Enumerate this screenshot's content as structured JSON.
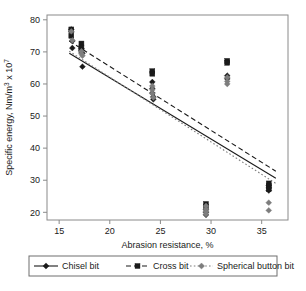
{
  "chart_data": {
    "type": "scatter",
    "title": "",
    "xlabel": "Abrasion resistance, %",
    "ylabel": "Specific energy, Nm/m3 x 107",
    "ylabel_parts": {
      "main": "Specific energy, Nm/m",
      "exp1": "3",
      "mid": " x 10",
      "exp2": "7"
    },
    "xlim": [
      13.8,
      37.6
    ],
    "ylim": [
      17.6,
      81.5
    ],
    "xticks": [
      15,
      20,
      25,
      30,
      35
    ],
    "yticks": [
      20,
      30,
      40,
      50,
      60,
      70,
      80
    ],
    "grid": false,
    "legend_position": "bottom",
    "series": [
      {
        "name": "Chisel bit",
        "marker": "diamond",
        "color": "#1a1a1a",
        "line_style": "solid",
        "points": [
          [
            16.2,
            77.0
          ],
          [
            16.2,
            76.2
          ],
          [
            16.3,
            73.4
          ],
          [
            16.3,
            71.2
          ],
          [
            17.2,
            71.0
          ],
          [
            17.2,
            70.4
          ],
          [
            17.3,
            69.6
          ],
          [
            17.3,
            65.4
          ],
          [
            24.2,
            60.6
          ],
          [
            24.2,
            58.6
          ],
          [
            24.2,
            57.2
          ],
          [
            24.3,
            56.0
          ],
          [
            24.3,
            55.2
          ],
          [
            31.6,
            62.6
          ],
          [
            31.6,
            61.6
          ],
          [
            29.5,
            20.8
          ],
          [
            29.5,
            20.0
          ],
          [
            29.5,
            19.2
          ],
          [
            35.7,
            28.4
          ],
          [
            35.7,
            27.6
          ],
          [
            35.7,
            26.8
          ]
        ],
        "fit": {
          "x": [
            16.0,
            36.4
          ],
          "y": [
            69.6,
            30.6
          ]
        }
      },
      {
        "name": "Cross bit",
        "marker": "square",
        "color": "#1a1a1a",
        "line_style": "dashed",
        "points": [
          [
            16.2,
            77.0
          ],
          [
            16.2,
            75.0
          ],
          [
            17.2,
            72.6
          ],
          [
            17.2,
            71.4
          ],
          [
            17.2,
            70.4
          ],
          [
            24.2,
            64.0
          ],
          [
            24.2,
            63.2
          ],
          [
            31.6,
            67.2
          ],
          [
            31.6,
            66.6
          ],
          [
            29.5,
            22.6
          ],
          [
            29.5,
            21.8
          ],
          [
            35.7,
            29.0
          ],
          [
            35.7,
            28.2
          ],
          [
            35.7,
            27.2
          ]
        ],
        "fit": {
          "x": [
            16.0,
            36.4
          ],
          "y": [
            73.4,
            32.8
          ]
        }
      },
      {
        "name": "Spherical button bit",
        "marker": "diamond-gray",
        "color": "#7d7d7d",
        "line_style": "dotted",
        "points": [
          [
            16.2,
            76.4
          ],
          [
            16.3,
            73.6
          ],
          [
            17.2,
            70.2
          ],
          [
            17.2,
            69.4
          ],
          [
            17.3,
            68.8
          ],
          [
            24.2,
            59.4
          ],
          [
            24.2,
            58.2
          ],
          [
            24.2,
            57.0
          ],
          [
            24.3,
            55.8
          ],
          [
            31.6,
            62.0
          ],
          [
            31.6,
            60.8
          ],
          [
            31.6,
            60.0
          ],
          [
            29.5,
            22.0
          ],
          [
            29.5,
            21.0
          ],
          [
            29.5,
            20.2
          ],
          [
            29.5,
            19.4
          ],
          [
            35.7,
            23.0
          ],
          [
            35.7,
            20.6
          ]
        ],
        "fit": {
          "x": [
            16.0,
            36.4
          ],
          "y": [
            70.2,
            29.0
          ]
        }
      }
    ],
    "legend": [
      {
        "label": "Chisel bit",
        "marker": "diamond",
        "color": "#1a1a1a",
        "line_style": "solid"
      },
      {
        "label": "Cross bit",
        "marker": "square",
        "color": "#1a1a1a",
        "line_style": "dashed"
      },
      {
        "label": "Spherical button bit",
        "marker": "diamond-gray",
        "color": "#7d7d7d",
        "line_style": "dotted"
      }
    ]
  },
  "axes": {
    "x_tick_labels": [
      "15",
      "20",
      "25",
      "30",
      "35"
    ],
    "y_tick_labels": [
      "20",
      "30",
      "40",
      "50",
      "60",
      "70",
      "80"
    ]
  },
  "colors": {
    "frame": "#8a8a8a",
    "dark_marker": "#1a1a1a",
    "gray_marker": "#7d7d7d",
    "text": "#1a1a1a",
    "background": "#ffffff"
  }
}
